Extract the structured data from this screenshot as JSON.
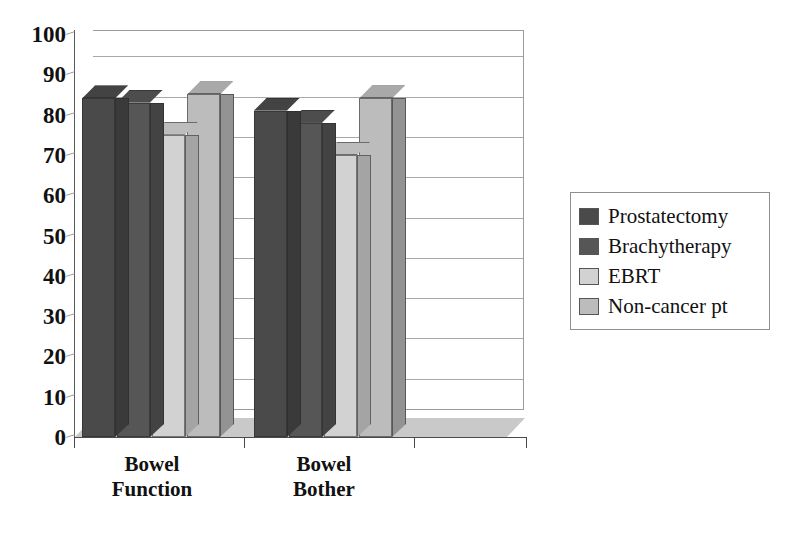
{
  "chart_data": {
    "type": "bar",
    "title": "",
    "subtitle": "",
    "xlabel": "",
    "ylabel": "",
    "categories": [
      "Bowel\nFunction",
      "Bowel\nBother"
    ],
    "series": [
      {
        "name": "Prostatectomy",
        "values": [
          84,
          81
        ],
        "color": "#4a4a4a"
      },
      {
        "name": "Brachytherapy",
        "values": [
          83,
          78
        ],
        "color": "#565656"
      },
      {
        "name": "EBRT",
        "values": [
          75,
          70
        ],
        "color": "#d2d2d2"
      },
      {
        "name": "Non-cancer pt",
        "values": [
          85,
          84
        ],
        "color": "#bcbcbc"
      }
    ],
    "ylim": [
      0,
      100
    ],
    "ytick_step": 10,
    "yticks": [
      "100",
      "90",
      "80",
      "70",
      "60",
      "50",
      "40",
      "30",
      "20",
      "10",
      "0"
    ],
    "grid": true,
    "legend_position": "right",
    "three_d": true
  },
  "legend": {
    "items": [
      {
        "label": "Prostatectomy",
        "color": "#4a4a4a"
      },
      {
        "label": "Brachytherapy",
        "color": "#565656"
      },
      {
        "label": "EBRT",
        "color": "#d2d2d2"
      },
      {
        "label": "Non-cancer pt",
        "color": "#bcbcbc"
      }
    ]
  },
  "axis": {
    "y_labels": [
      "100",
      "90",
      "80",
      "70",
      "60",
      "50",
      "40",
      "30",
      "20",
      "10",
      "0"
    ],
    "x_labels": [
      "Bowel\nFunction",
      "Bowel\nBother"
    ]
  }
}
